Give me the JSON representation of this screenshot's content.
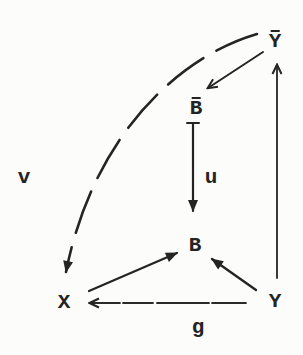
{
  "diagram": {
    "type": "commutative-diagram",
    "nodes": {
      "y_bar": {
        "label": "Y",
        "overline": true
      },
      "b_bar": {
        "label": "B",
        "overline": true
      },
      "b": {
        "label": "B",
        "overline": false
      },
      "x": {
        "label": "X",
        "overline": false
      },
      "y": {
        "label": "Y",
        "overline": false
      }
    },
    "edge_labels": {
      "v": "v",
      "u": "u",
      "g": "g"
    },
    "edges": [
      {
        "from": "Y-bar",
        "to": "B-bar",
        "style": "solid",
        "label": ""
      },
      {
        "from": "B-bar",
        "to": "B",
        "style": "solid",
        "label": "u"
      },
      {
        "from": "Y-bar",
        "to": "X",
        "style": "dashed-arc",
        "label": "v"
      },
      {
        "from": "X",
        "to": "B",
        "style": "solid",
        "label": ""
      },
      {
        "from": "Y",
        "to": "B",
        "style": "solid",
        "label": ""
      },
      {
        "from": "Y",
        "to": "Y-bar",
        "style": "solid",
        "label": ""
      },
      {
        "from": "Y",
        "to": "X",
        "style": "solid",
        "label": "g"
      }
    ],
    "colors": {
      "ink": "#242424",
      "paper": "#fcfcfa"
    }
  }
}
